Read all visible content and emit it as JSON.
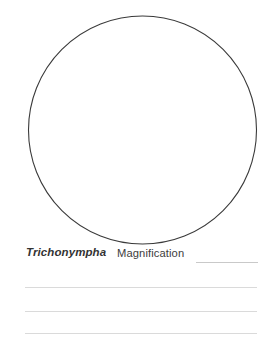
{
  "worksheet": {
    "width": 273,
    "height": 346,
    "background_color": "#ffffff"
  },
  "drawing_area": {
    "shape": "circle",
    "icon_name": "microscope-field-of-view-circle",
    "center_x": 142.5,
    "center_y": 130,
    "radius": 114,
    "stroke_color": "#3a3a3a",
    "stroke_width": 1,
    "fill": "none"
  },
  "caption": {
    "specimen_name": "Trichonympha",
    "magnification_label": "Magnification",
    "magnification_value": "",
    "blank_rule_color": "#c9c9c9",
    "text_color": "#333333"
  },
  "notes": {
    "line_color": "#dadada",
    "lines": [
      "",
      "",
      ""
    ]
  }
}
